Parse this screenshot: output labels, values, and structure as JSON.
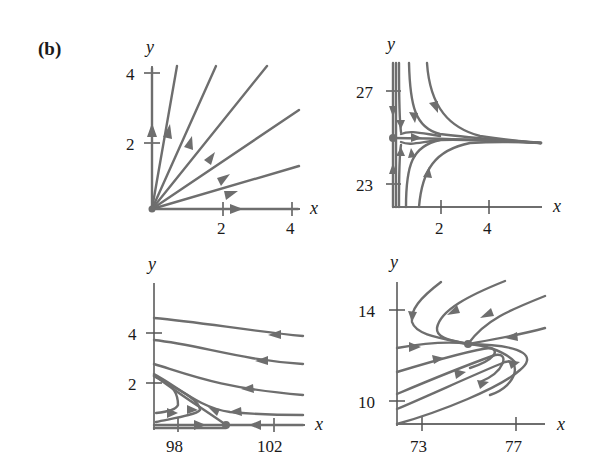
{
  "figure": {
    "label": "(b)",
    "colors": {
      "curve": "#6e6e6e",
      "text": "#1a1a1a",
      "background": "#ffffff"
    }
  },
  "panels": [
    {
      "id": "top-left",
      "x_label": "x",
      "y_label": "y",
      "x_ticks": [
        "2",
        "4"
      ],
      "y_ticks": [
        "2",
        "4"
      ],
      "description": "Unstable node at origin; straight trajectories radiating outward"
    },
    {
      "id": "top-right",
      "x_label": "x",
      "y_label": "y",
      "x_ticks": [
        "2",
        "4"
      ],
      "y_ticks": [
        "27",
        "23"
      ],
      "description": "Trajectories converge toward y≈25 as x increases; equilibrium at (0,25)"
    },
    {
      "id": "bottom-left",
      "x_label": "x",
      "y_label": "y",
      "x_ticks": [
        "98",
        "102"
      ],
      "y_ticks": [
        "4",
        "2"
      ],
      "description": "Trajectories moving left; saddle-type equilibrium on x-axis near x≈100"
    },
    {
      "id": "bottom-right",
      "x_label": "x",
      "y_label": "y",
      "x_ticks": [
        "73",
        "77"
      ],
      "y_ticks": [
        "14",
        "10"
      ],
      "description": "Spiral/saddle-like flow around equilibrium near (75,12.5)"
    }
  ]
}
